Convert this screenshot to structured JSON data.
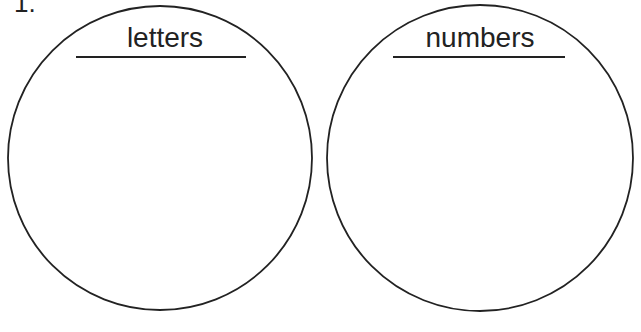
{
  "question": {
    "number": "1."
  },
  "circles": [
    {
      "label": "letters",
      "cx": 160,
      "cy": 158,
      "r": 152
    },
    {
      "label": "numbers",
      "cx": 480,
      "cy": 158,
      "r": 153
    }
  ],
  "colors": {
    "stroke": "#222222",
    "background": "#ffffff"
  }
}
